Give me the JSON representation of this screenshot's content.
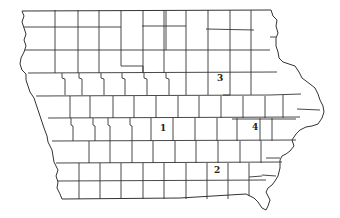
{
  "map": {
    "region": "Iowa counties outline",
    "colors": {
      "background": "#ffffff",
      "lines": "#333333",
      "labels": "#222222"
    },
    "labels": [
      {
        "id": "1",
        "text": "1",
        "x": 160,
        "y": 124
      },
      {
        "id": "2",
        "text": "2",
        "x": 214,
        "y": 166
      },
      {
        "id": "3",
        "text": "3",
        "x": 217,
        "y": 74
      },
      {
        "id": "4",
        "text": "4",
        "x": 252,
        "y": 123
      }
    ]
  }
}
